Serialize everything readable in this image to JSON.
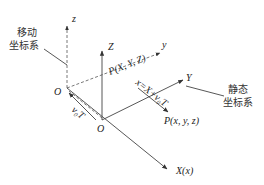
{
  "diagram": {
    "title": "",
    "moving_frame": {
      "label_line1": "移动",
      "label_line2": "坐标系",
      "origin": "O",
      "axis_z": "z",
      "axis_y": "y"
    },
    "static_frame": {
      "label_line1": "静态",
      "label_line2": "坐标系",
      "origin": "O",
      "axis_Z": "Z",
      "axis_Y": "Y",
      "axis_X": "X(x)"
    },
    "points": {
      "moving_point": "P(X, Y, Z)",
      "static_point": "P(x, y, z)"
    },
    "annotations": {
      "offset": "v₀T",
      "transform": "x=X+v₀T"
    },
    "colors": {
      "line": "#444444",
      "text": "#222222",
      "background": "#ffffff"
    }
  }
}
